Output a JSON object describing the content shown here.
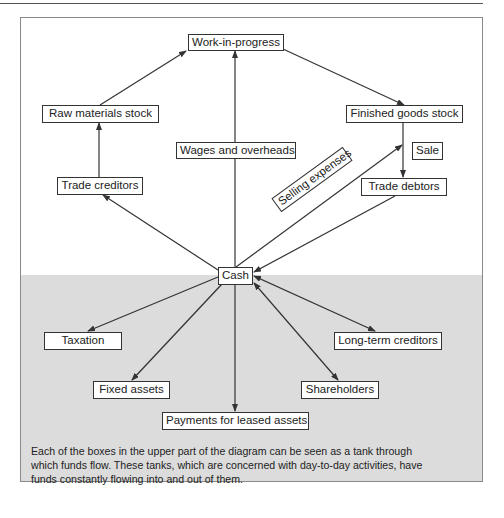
{
  "diagram": {
    "colors": {
      "upper_bg": "#ffffff",
      "lower_bg": "#dcdcdc",
      "line": "#333333"
    },
    "nodes": {
      "work_in_progress": "Work-in-progress",
      "raw_materials_stock": "Raw materials stock",
      "wages_and_overheads": "Wages and overheads",
      "finished_goods_stock": "Finished goods stock",
      "sale": "Sale",
      "trade_creditors": "Trade creditors",
      "trade_debtors": "Trade debtors",
      "selling_expenses": "Selling expenses",
      "cash": "Cash",
      "taxation": "Taxation",
      "long_term_creditors": "Long-term creditors",
      "fixed_assets": "Fixed assets",
      "shareholders": "Shareholders",
      "payments_for_leased_assets": "Payments for leased assets"
    },
    "edges": [
      {
        "from": "Trade creditors",
        "to": "Raw materials stock"
      },
      {
        "from": "Raw materials stock",
        "to": "Work-in-progress"
      },
      {
        "from": "Wages and overheads",
        "to": "Work-in-progress"
      },
      {
        "from": "Work-in-progress",
        "to": "Finished goods stock"
      },
      {
        "from": "Finished goods stock",
        "to": "Trade debtors",
        "label": "Sale"
      },
      {
        "from": "Cash",
        "to": "Trade creditors"
      },
      {
        "from": "Cash",
        "to": "Finished goods stock",
        "label": "Selling expenses"
      },
      {
        "from": "Trade debtors",
        "to": "Cash"
      },
      {
        "from": "Cash",
        "to": "Taxation"
      },
      {
        "from": "Cash",
        "to": "Fixed assets"
      },
      {
        "from": "Cash",
        "to": "Payments for leased assets"
      },
      {
        "from": "Cash",
        "to": "Shareholders",
        "bidirectional": true
      },
      {
        "from": "Cash",
        "to": "Long-term creditors",
        "bidirectional": true
      }
    ]
  },
  "caption": {
    "lines": [
      "Each of the boxes in the upper part of the diagram can be seen as a tank through",
      "which funds flow. These tanks, which are concerned with day-to-day activities, have",
      "funds constantly flowing into and out of them."
    ]
  }
}
